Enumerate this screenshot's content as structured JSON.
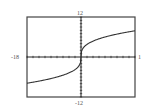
{
  "header": {
    "figure_number": ""
  },
  "labels": {
    "ymax": "12",
    "ymin": "-12",
    "xmin": "-18",
    "xmax": "1"
  },
  "colors": {
    "frame": "#444444",
    "axis": "#222222",
    "curve": "#333333"
  },
  "chart_data": {
    "type": "line",
    "title": "",
    "xlabel": "",
    "ylabel": "",
    "xlim": [
      -18,
      18
    ],
    "ylim": [
      -12,
      12
    ],
    "grid": false,
    "x_tick_step": 2,
    "y_tick_step": 1,
    "series": [
      {
        "name": "f(x) ≈ 3·∛x",
        "x": [
          -18,
          -15,
          -12,
          -9,
          -6,
          -3,
          -1,
          -0.2,
          0,
          0.2,
          1,
          3,
          6,
          9,
          12,
          15,
          18
        ],
        "y": [
          -7.86,
          -7.4,
          -6.87,
          -6.24,
          -5.45,
          -4.33,
          -3.0,
          -1.75,
          0,
          1.75,
          3.0,
          4.33,
          5.45,
          6.24,
          6.87,
          7.4,
          7.86
        ]
      }
    ]
  }
}
